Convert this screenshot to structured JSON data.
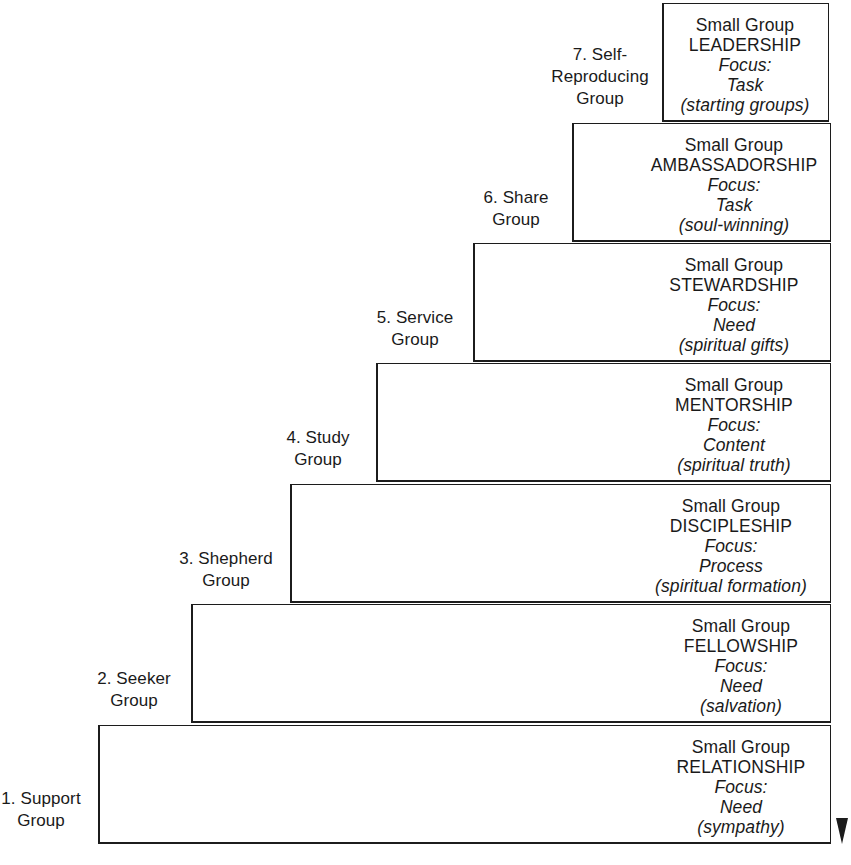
{
  "diagram": {
    "line_color": "#1c1c1c",
    "background": "#ffffff",
    "text_color": "#1a1a1a",
    "focus_label": "Focus:",
    "prefix_label": "Small Group"
  },
  "steps": [
    {
      "number": "1",
      "label_lines": [
        "1. Support",
        "Group"
      ],
      "label_full": "1. Support Group",
      "prefix": "Small Group",
      "title": "RELATIONSHIP",
      "focus_label": "Focus:",
      "focus_value": "Need",
      "parenthetical": "(sympathy)"
    },
    {
      "number": "2",
      "label_lines": [
        "2. Seeker",
        "Group"
      ],
      "label_full": "2. Seeker Group",
      "prefix": "Small Group",
      "title": "FELLOWSHIP",
      "focus_label": "Focus:",
      "focus_value": "Need",
      "parenthetical": "(salvation)"
    },
    {
      "number": "3",
      "label_lines": [
        "3. Shepherd",
        "Group"
      ],
      "label_full": "3. Shepherd Group",
      "prefix": "Small Group",
      "title": "DISCIPLESHIP",
      "focus_label": "Focus:",
      "focus_value": "Process",
      "parenthetical": "(spiritual formation)"
    },
    {
      "number": "4",
      "label_lines": [
        "4. Study",
        "Group"
      ],
      "label_full": "4. Study Group",
      "prefix": "Small Group",
      "title": "MENTORSHIP",
      "focus_label": "Focus:",
      "focus_value": "Content",
      "parenthetical": "(spiritual truth)"
    },
    {
      "number": "5",
      "label_lines": [
        "5. Service",
        "Group"
      ],
      "label_full": "5. Service Group",
      "prefix": "Small Group",
      "title": "STEWARDSHIP",
      "focus_label": "Focus:",
      "focus_value": "Need",
      "parenthetical": "(spiritual gifts)"
    },
    {
      "number": "6",
      "label_lines": [
        "6. Share",
        "Group"
      ],
      "label_full": "6. Share Group",
      "prefix": "Small Group",
      "title": "AMBASSADORSHIP",
      "focus_label": "Focus:",
      "focus_value": "Task",
      "parenthetical": "(soul-winning)"
    },
    {
      "number": "7",
      "label_lines": [
        "7. Self-",
        "Reproducing",
        "Group"
      ],
      "label_full": "7. Self-Reproducing Group",
      "prefix": "Small Group",
      "title": "LEADERSHIP",
      "focus_label": "Focus:",
      "focus_value": "Task",
      "parenthetical": "(starting groups)"
    }
  ]
}
